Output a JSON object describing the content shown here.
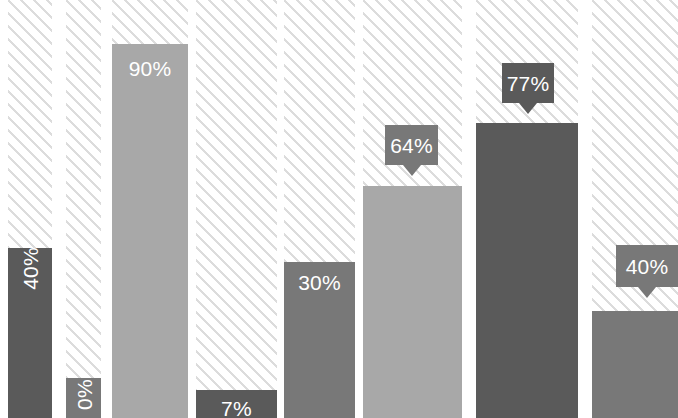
{
  "chart_data": {
    "type": "bar",
    "title": "",
    "subtitle": "",
    "xlabel": "",
    "ylabel": "",
    "ylim": [
      0,
      100
    ],
    "grid": false,
    "legend": null,
    "categories": [
      "1",
      "2",
      "3",
      "4",
      "5",
      "6",
      "7",
      "8"
    ],
    "values": [
      40,
      0,
      90,
      7,
      30,
      64,
      77,
      40
    ],
    "value_labels": [
      "40%",
      "0%",
      "90%",
      "7%",
      "30%",
      "64%",
      "77%",
      "40%"
    ],
    "colors": {
      "dark": "#5a5a5a",
      "medium": "#787878",
      "light": "#a8a8a8",
      "hatch_stripe": "#dcdcdc",
      "background": "#ffffff",
      "label_text": "#ffffff"
    },
    "note": "Zoomed crop of a bar chart; axes and tick labels are outside the visible frame",
    "bars": [
      {
        "id": "bar-1",
        "label": "40%",
        "value": 40,
        "color": "#5a5a5a",
        "label_style": "inside-vertical",
        "column": {
          "left": 8,
          "width": 44
        },
        "geometry": {
          "left": 8,
          "width": 44,
          "top": 248
        },
        "label_pos": {
          "top": 258
        }
      },
      {
        "id": "bar-2",
        "label": "0%",
        "value": 0,
        "color": "#787878",
        "label_style": "inside-vertical",
        "column": {
          "left": 66,
          "width": 35
        },
        "geometry": {
          "left": 66,
          "width": 35,
          "top": 378
        },
        "label_pos": {
          "top": 384
        }
      },
      {
        "id": "bar-3",
        "label": "90%",
        "value": 90,
        "color": "#a8a8a8",
        "label_style": "inside-horizontal",
        "column": {
          "left": 112,
          "width": 76
        },
        "geometry": {
          "left": 112,
          "width": 76,
          "top": 44
        },
        "label_pos": {
          "top": 58
        }
      },
      {
        "id": "bar-4",
        "label": "7%",
        "value": 7,
        "color": "#5a5a5a",
        "label_style": "inside-horizontal",
        "column": {
          "left": 196,
          "width": 81
        },
        "geometry": {
          "left": 196,
          "width": 81,
          "top": 390
        },
        "label_pos": {
          "top": 398
        }
      },
      {
        "id": "bar-5",
        "label": "30%",
        "value": 30,
        "color": "#787878",
        "label_style": "inside-horizontal",
        "column": {
          "left": 284,
          "width": 71
        },
        "geometry": {
          "left": 284,
          "width": 71,
          "top": 262
        },
        "label_pos": {
          "top": 272
        }
      },
      {
        "id": "bar-6",
        "label": "64%",
        "value": 64,
        "color": "#a8a8a8",
        "label_style": "callout",
        "column": {
          "left": 363,
          "width": 99
        },
        "geometry": {
          "left": 363,
          "width": 99,
          "top": 186
        },
        "callout": {
          "left": 385,
          "top": 125,
          "width": 53,
          "height": 40,
          "bg": "#787878"
        }
      },
      {
        "id": "bar-7",
        "label": "77%",
        "value": 77,
        "color": "#5a5a5a",
        "label_style": "callout",
        "column": {
          "left": 476,
          "width": 102
        },
        "geometry": {
          "left": 476,
          "width": 102,
          "top": 123
        },
        "callout": {
          "left": 502,
          "top": 63,
          "width": 52,
          "height": 40,
          "bg": "#5a5a5a"
        }
      },
      {
        "id": "bar-8",
        "label": "40%",
        "value": 40,
        "color": "#787878",
        "label_style": "callout",
        "column": {
          "left": 592,
          "width": 86
        },
        "geometry": {
          "left": 592,
          "width": 86,
          "top": 311
        },
        "callout": {
          "left": 616,
          "top": 245,
          "width": 62,
          "height": 42,
          "bg": "#787878"
        }
      }
    ],
    "hatch_columns": [
      {
        "left": 8,
        "width": 44
      },
      {
        "left": 66,
        "width": 35
      },
      {
        "left": 112,
        "width": 76
      },
      {
        "left": 196,
        "width": 81
      },
      {
        "left": 284,
        "width": 71
      },
      {
        "left": 363,
        "width": 99
      },
      {
        "left": 476,
        "width": 102
      },
      {
        "left": 592,
        "width": 86
      }
    ]
  }
}
